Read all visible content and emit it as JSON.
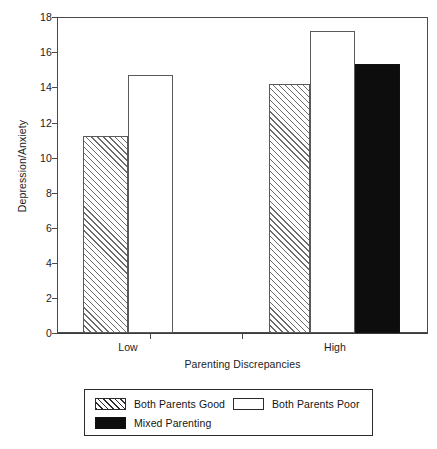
{
  "chart_data": {
    "type": "bar",
    "title": "",
    "xlabel": "Parenting Discrepancies",
    "ylabel": "Depression/Anxiety",
    "categories": [
      "Low",
      "High"
    ],
    "ylim": [
      0,
      18
    ],
    "yticks": [
      0,
      2,
      4,
      6,
      8,
      10,
      12,
      14,
      16,
      18
    ],
    "ytick_labels": [
      "0",
      "2",
      "4",
      "6",
      "8",
      "10",
      "12",
      "14",
      "16",
      "18"
    ],
    "grid": false,
    "legend_position": "below-axes",
    "series": [
      {
        "name": "Both Parents Good",
        "fill": "diagonal-hatch",
        "color": "#ffffff",
        "edge_color": "#5a5a5a",
        "values": [
          11.2,
          14.2
        ]
      },
      {
        "name": "Both Parents Poor",
        "fill": "solid-white",
        "color": "#ffffff",
        "edge_color": "#5a5a5a",
        "values": [
          14.7,
          17.2
        ]
      },
      {
        "name": "Mixed Parenting",
        "fill": "solid-black",
        "color": "#0d0d0d",
        "edge_color": "#111111",
        "values": [
          null,
          15.3
        ]
      }
    ]
  },
  "axes": {
    "y_ticks": [
      {
        "label": "18",
        "value": 18
      },
      {
        "label": "16",
        "value": 16
      },
      {
        "label": "14",
        "value": 14
      },
      {
        "label": "12",
        "value": 12
      },
      {
        "label": "10",
        "value": 10
      },
      {
        "label": "8",
        "value": 8
      },
      {
        "label": "6",
        "value": 6
      },
      {
        "label": "4",
        "value": 4
      },
      {
        "label": "2",
        "value": 2
      },
      {
        "label": "0",
        "value": 0
      }
    ],
    "y_title": "Depression/Anxiety",
    "x_title": "Parenting Discrepancies",
    "x_ticks": [
      {
        "label": "Low"
      },
      {
        "label": "High"
      }
    ]
  },
  "bars": [
    {
      "group": "Low",
      "series": "Both Parents Good",
      "value": 11.2,
      "style": "hatch"
    },
    {
      "group": "Low",
      "series": "Both Parents Poor",
      "value": 14.7,
      "style": "white"
    },
    {
      "group": "High",
      "series": "Both Parents Good",
      "value": 14.2,
      "style": "hatch"
    },
    {
      "group": "High",
      "series": "Both Parents Poor",
      "value": 17.2,
      "style": "white"
    },
    {
      "group": "High",
      "series": "Mixed Parenting",
      "value": 15.3,
      "style": "black"
    }
  ],
  "legend": {
    "entries": [
      {
        "label": "Both Parents Good",
        "style": "hatch"
      },
      {
        "label": "Both Parents Poor",
        "style": "white"
      },
      {
        "label": "Mixed Parenting",
        "style": "black"
      }
    ]
  }
}
